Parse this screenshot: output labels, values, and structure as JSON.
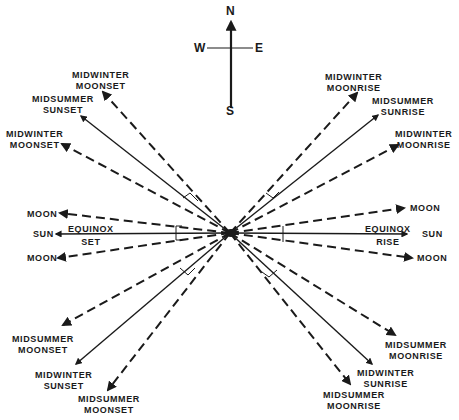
{
  "diagram": {
    "type": "azimuth rise/set diagram",
    "compass": {
      "north": "N",
      "south": "S",
      "east": "E",
      "west": "W"
    },
    "center": [
      230,
      233
    ],
    "colors": {
      "ink": "#1a1a1a",
      "background": "#ffffff"
    },
    "rays": [
      {
        "id": "midwinter-moonset-far",
        "style": "dashed",
        "end": [
          103,
          92
        ],
        "label": [
          "MIDWINTER",
          "MOONSET"
        ]
      },
      {
        "id": "midsummer-sunset",
        "style": "solid",
        "end": [
          81,
          116
        ],
        "label": [
          "MIDSUMMER",
          "SUNSET"
        ]
      },
      {
        "id": "midwinter-moonset-near",
        "style": "dashed",
        "end": [
          62,
          144
        ],
        "label": [
          "MIDWINTER",
          "MOONSET"
        ]
      },
      {
        "id": "equinox-moonset-north",
        "style": "dashed",
        "end": [
          60,
          213
        ],
        "label": [
          "MOON"
        ]
      },
      {
        "id": "equinox-sunset",
        "style": "solid",
        "end": [
          56,
          234
        ],
        "label": [
          "SUN"
        ]
      },
      {
        "id": "equinox-moonset-south",
        "style": "dashed",
        "end": [
          58,
          258
        ],
        "label": [
          "MOON"
        ]
      },
      {
        "id": "midsummer-moonset-near",
        "style": "dashed",
        "end": [
          63,
          325
        ],
        "label": [
          "MIDSUMMER",
          "MOONSET"
        ]
      },
      {
        "id": "midwinter-sunset",
        "style": "solid",
        "end": [
          76,
          364
        ],
        "label": [
          "MIDWINTER",
          "SUNSET"
        ]
      },
      {
        "id": "midsummer-moonset-far",
        "style": "dashed",
        "end": [
          108,
          390
        ],
        "label": [
          "MIDSUMMER",
          "MOONSET"
        ]
      },
      {
        "id": "midwinter-moonrise-far",
        "style": "dashed",
        "end": [
          357,
          93
        ],
        "label": [
          "MIDWINTER",
          "MOONRISE"
        ]
      },
      {
        "id": "midsummer-sunrise",
        "style": "solid",
        "end": [
          378,
          115
        ],
        "label": [
          "MIDSUMMER",
          "SUNRISE"
        ]
      },
      {
        "id": "midwinter-moonrise-near",
        "style": "dashed",
        "end": [
          398,
          145
        ],
        "label": [
          "MIDWINTER",
          "MOONRISE"
        ]
      },
      {
        "id": "equinox-moonrise-north",
        "style": "dashed",
        "end": [
          404,
          208
        ],
        "label": [
          "MOON"
        ]
      },
      {
        "id": "equinox-sunrise",
        "style": "solid",
        "end": [
          407,
          234
        ],
        "label": [
          "SUN"
        ]
      },
      {
        "id": "equinox-moonrise-south",
        "style": "dashed",
        "end": [
          412,
          258
        ],
        "label": [
          "MOON"
        ]
      },
      {
        "id": "midsummer-moonrise-near",
        "style": "dashed",
        "end": [
          395,
          335
        ],
        "label": [
          "MIDSUMMER",
          "MOONRISE"
        ]
      },
      {
        "id": "midwinter-sunrise",
        "style": "solid",
        "end": [
          372,
          364
        ],
        "label": [
          "MIDWINTER",
          "SUNRISE"
        ]
      },
      {
        "id": "midsummer-moonrise-far",
        "style": "dashed",
        "end": [
          350,
          384
        ],
        "label": [
          "MIDSUMMER",
          "MOONRISE"
        ]
      }
    ],
    "inline_labels": {
      "equinox_set": [
        "EQUINOX",
        "SET"
      ],
      "equinox_rise": [
        "EQUINOX",
        "RISE"
      ]
    }
  }
}
